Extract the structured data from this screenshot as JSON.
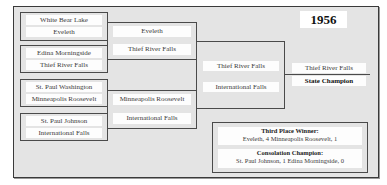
{
  "year": "1956",
  "bracket": {
    "round1": [
      {
        "top": "White Bear Lake",
        "bottom": "Eveleth"
      },
      {
        "top": "Edina Morningside",
        "bottom": "Thief River Falls"
      },
      {
        "top": "St. Paul Washington",
        "bottom": "Minneapolis Roosevelt"
      },
      {
        "top": "St. Paul Johnson",
        "bottom": "International Falls"
      }
    ],
    "semifinals": [
      {
        "top": "Eveleth",
        "bottom": "Thief River Falls"
      },
      {
        "top": "Minneapolis Roosevelt",
        "bottom": "International Falls"
      }
    ],
    "final": {
      "top": "Thief River Falls",
      "bottom": "International Falls"
    },
    "champion": {
      "team": "Thief River Falls",
      "label": "State Champion"
    }
  },
  "third_place": {
    "title": "Third Place Winner:",
    "result": "Eveleth, 4  Minneapolis Roosevelt, 1"
  },
  "consolation": {
    "title": "Consolation Champion:",
    "result": "St. Paul Johnson, 1  Edina Morningside, 0"
  },
  "colors": {
    "background": "#e4e4e4",
    "line": "#4a4a4a",
    "label_bg": "#fdfdfd"
  }
}
